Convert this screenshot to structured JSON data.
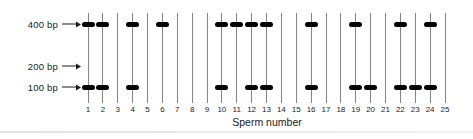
{
  "figure": {
    "markers": [
      {
        "label": "400 bp"
      },
      {
        "label": "200 bp"
      },
      {
        "label": "100 bp"
      }
    ],
    "x_axis_label": "Sperm number",
    "lanes": [
      {
        "number": "1",
        "band_400bp": true,
        "band_100bp": true
      },
      {
        "number": "2",
        "band_400bp": true,
        "band_100bp": true
      },
      {
        "number": "3",
        "band_400bp": false,
        "band_100bp": false
      },
      {
        "number": "4",
        "band_400bp": true,
        "band_100bp": true
      },
      {
        "number": "5",
        "band_400bp": false,
        "band_100bp": false
      },
      {
        "number": "6",
        "band_400bp": true,
        "band_100bp": false
      },
      {
        "number": "7",
        "band_400bp": false,
        "band_100bp": false
      },
      {
        "number": "8",
        "band_400bp": false,
        "band_100bp": false
      },
      {
        "number": "9",
        "band_400bp": false,
        "band_100bp": false
      },
      {
        "number": "10",
        "band_400bp": true,
        "band_100bp": true
      },
      {
        "number": "11",
        "band_400bp": true,
        "band_100bp": false
      },
      {
        "number": "12",
        "band_400bp": true,
        "band_100bp": true
      },
      {
        "number": "13",
        "band_400bp": true,
        "band_100bp": true
      },
      {
        "number": "14",
        "band_400bp": false,
        "band_100bp": false
      },
      {
        "number": "15",
        "band_400bp": false,
        "band_100bp": false
      },
      {
        "number": "16",
        "band_400bp": true,
        "band_100bp": true
      },
      {
        "number": "17",
        "band_400bp": false,
        "band_100bp": false
      },
      {
        "number": "18",
        "band_400bp": false,
        "band_100bp": false
      },
      {
        "number": "19",
        "band_400bp": true,
        "band_100bp": true
      },
      {
        "number": "20",
        "band_400bp": false,
        "band_100bp": true
      },
      {
        "number": "21",
        "band_400bp": false,
        "band_100bp": false
      },
      {
        "number": "22",
        "band_400bp": true,
        "band_100bp": true
      },
      {
        "number": "23",
        "band_400bp": false,
        "band_100bp": true
      },
      {
        "number": "24",
        "band_400bp": true,
        "band_100bp": true
      },
      {
        "number": "25",
        "band_400bp": false,
        "band_100bp": false
      }
    ],
    "colors": {
      "band": "#000000",
      "lane_line": "#848484",
      "text": "#1a1a1a"
    }
  }
}
